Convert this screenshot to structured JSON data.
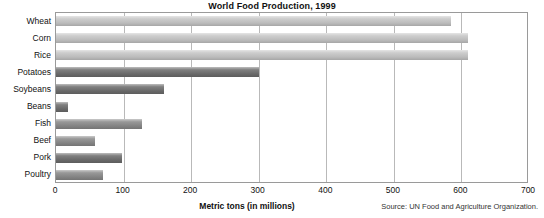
{
  "chart_data": {
    "type": "bar",
    "orientation": "horizontal",
    "title": "World Food Production, 1999",
    "xlabel": "Metric tons (in millions)",
    "ylabel": "",
    "xlim": [
      0,
      700
    ],
    "ylim": null,
    "grid": "vertical",
    "legend": null,
    "source_note": "Source: UN Food and Agriculture Organization.",
    "xticks": [
      0,
      100,
      200,
      300,
      400,
      500,
      600,
      700
    ],
    "xtick_labels": [
      "0",
      "100",
      "200",
      "300",
      "400",
      "500",
      "600",
      "700"
    ],
    "categories": [
      "Wheat",
      "Corn",
      "Rice",
      "Potatoes",
      "Soybeans",
      "Beans",
      "Fish",
      "Beef",
      "Pork",
      "Poultry"
    ],
    "values": [
      585,
      610,
      610,
      300,
      160,
      18,
      128,
      58,
      97,
      70
    ],
    "bars": [
      {
        "label": "Wheat",
        "value": 585,
        "color": "#c6c6c6",
        "shade": "light"
      },
      {
        "label": "Corn",
        "value": 610,
        "color": "#c6c6c6",
        "shade": "light"
      },
      {
        "label": "Rice",
        "value": 610,
        "color": "#c6c6c6",
        "shade": "light"
      },
      {
        "label": "Potatoes",
        "value": 300,
        "color": "#6e6e6e",
        "shade": "dark"
      },
      {
        "label": "Soybeans",
        "value": 160,
        "color": "#6e6e6e",
        "shade": "dark"
      },
      {
        "label": "Beans",
        "value": 18,
        "color": "#6e6e6e",
        "shade": "dark"
      },
      {
        "label": "Fish",
        "value": 128,
        "color": "#8a8a8a",
        "shade": "dark"
      },
      {
        "label": "Beef",
        "value": 58,
        "color": "#8a8a8a",
        "shade": "dark"
      },
      {
        "label": "Pork",
        "value": 97,
        "color": "#6e6e6e",
        "shade": "dark"
      },
      {
        "label": "Poultry",
        "value": 70,
        "color": "#8a8a8a",
        "shade": "dark"
      }
    ]
  },
  "colors": {
    "background": "#ffffff",
    "text": "#111111",
    "gridline": "#b9b9b9",
    "frame": "#9a9a9a",
    "bar_light": "#c6c6c6",
    "bar_dark": "#6e6e6e"
  }
}
